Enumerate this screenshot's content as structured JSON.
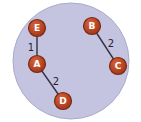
{
  "diagram": {
    "type": "graph",
    "background_circle": {
      "cx": 71,
      "cy": 61,
      "r": 58,
      "fill": "#c4c4e0",
      "stroke": "#aaaacc"
    },
    "node_color": "#b8401c",
    "node_border": "#7a2a12",
    "edge_color": "#333344",
    "nodes": [
      {
        "id": "E",
        "label": "E",
        "x": 37,
        "y": 28
      },
      {
        "id": "A",
        "label": "A",
        "x": 37,
        "y": 64
      },
      {
        "id": "D",
        "label": "D",
        "x": 63,
        "y": 101
      },
      {
        "id": "B",
        "label": "B",
        "x": 92,
        "y": 26
      },
      {
        "id": "C",
        "label": "C",
        "x": 118,
        "y": 66
      }
    ],
    "edges": [
      {
        "from": "E",
        "to": "A",
        "weight": "1",
        "lx": 31,
        "ly": 48
      },
      {
        "from": "A",
        "to": "D",
        "weight": "2",
        "lx": 56,
        "ly": 82
      },
      {
        "from": "B",
        "to": "C",
        "weight": "2",
        "lx": 111,
        "ly": 44
      }
    ]
  }
}
